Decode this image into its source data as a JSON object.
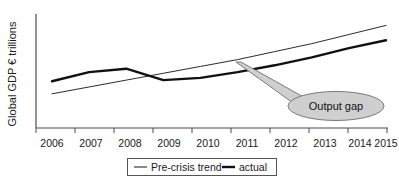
{
  "chart_data": {
    "type": "line",
    "title": "",
    "xlabel": "",
    "ylabel": "Global GDP € trillions",
    "categories": [
      "2006",
      "2007",
      "2008",
      "2009",
      "2010",
      "2011",
      "2012",
      "2013",
      "2014",
      "2015"
    ],
    "x": [
      2006,
      2007,
      2008,
      2009,
      2010,
      2011,
      2012,
      2013,
      2014,
      2015
    ],
    "grid": false,
    "legend_position": "bottom",
    "ylim": [
      0,
      100
    ],
    "yticks_shown": false,
    "series": [
      {
        "name": "Pre-crisis trend",
        "style": "thin",
        "values": [
          30,
          36,
          42,
          48,
          54,
          60,
          67,
          74,
          82,
          90
        ]
      },
      {
        "name": "actual",
        "style": "thick",
        "values": [
          41,
          49,
          52,
          42,
          44,
          49,
          55,
          62,
          70,
          77
        ]
      }
    ],
    "annotations": [
      {
        "label": "Output gap",
        "shape": "ellipse-callout",
        "anchor_x": 2011.0,
        "fill_color": "#cfcfcf",
        "stroke_color": "#6e6e6e"
      }
    ]
  },
  "legend": {
    "items": [
      {
        "label": "Pre-crisis trend",
        "style": "thin"
      },
      {
        "label": "actual",
        "style": "thick"
      }
    ]
  },
  "axis": {
    "y_label": "Global GDP € trillions",
    "x_tick_labels": [
      "2006",
      "2007",
      "2008",
      "2009",
      "2010",
      "2011",
      "2012",
      "2013",
      "2014",
      "2015"
    ]
  },
  "annotation": {
    "output_gap_label": "Output gap"
  },
  "colors": {
    "background": "#ffffff",
    "axis": "#4a4a4a",
    "trend_line": "#2b2b2b",
    "actual_line": "#111111",
    "callout_fill": "#cfcfcf",
    "callout_stroke": "#6e6e6e",
    "text": "#1a1a1a"
  }
}
